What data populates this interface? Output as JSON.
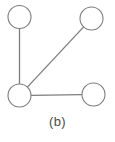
{
  "figure": {
    "caption": "(b)",
    "background_color": "#ffffff",
    "stroke_color": "#7d7d7d",
    "node_fill_color": "#ffffff",
    "caption_color": "#4a4a4a"
  },
  "chart_data": {
    "type": "diagram",
    "diagram_kind": "undirected-graph",
    "title": "(b)",
    "xlabel": "",
    "ylabel": "",
    "grid": false,
    "legend": null,
    "node_radius": 11.5,
    "nodes": [
      {
        "id": "n1",
        "label": "",
        "cx": 19.5,
        "cy": 17.0,
        "r": 11.5,
        "position": "top-left"
      },
      {
        "id": "n2",
        "label": "",
        "cx": 91.5,
        "cy": 18.5,
        "r": 11.5,
        "position": "top-right"
      },
      {
        "id": "n3",
        "label": "",
        "cx": 19.5,
        "cy": 95.5,
        "r": 11.5,
        "position": "bottom-left-hub"
      },
      {
        "id": "n4",
        "label": "",
        "cx": 93.5,
        "cy": 94.5,
        "r": 11.5,
        "position": "bottom-right"
      }
    ],
    "edges": [
      {
        "id": "e1",
        "source": "n1",
        "target": "n3",
        "orientation": "vertical"
      },
      {
        "id": "e2",
        "source": "n3",
        "target": "n2",
        "orientation": "diagonal"
      },
      {
        "id": "e3",
        "source": "n3",
        "target": "n4",
        "orientation": "horizontal"
      }
    ],
    "node_count": 4,
    "edge_count": 3,
    "degrees": {
      "n1": 1,
      "n2": 1,
      "n3": 3,
      "n4": 1
    }
  }
}
